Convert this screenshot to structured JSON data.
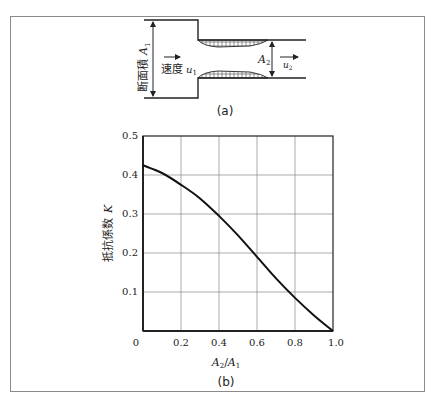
{
  "diagram_a": {
    "caption": "(a)",
    "area1_label": "断面積",
    "area1_symbol": "A",
    "area1_sub": "1",
    "area2_symbol": "A",
    "area2_sub": "2",
    "velocity_label": "速度",
    "u1_symbol": "u",
    "u1_sub": "1",
    "u2_symbol": "u",
    "u2_sub": "2"
  },
  "chart_caption": "(b)",
  "chart_data": {
    "type": "line",
    "title": "",
    "xlabel": "A2/A1",
    "ylabel": "抵抗係数 K",
    "xlim": [
      0,
      1.0
    ],
    "ylim": [
      0,
      0.5
    ],
    "x_ticks": [
      "0",
      "0.2",
      "0.4",
      "0.6",
      "0.8",
      "1.0"
    ],
    "y_ticks": [
      "0.1",
      "0.2",
      "0.3",
      "0.4",
      "0.5"
    ],
    "grid": true,
    "series": [
      {
        "name": "K",
        "x": [
          0.0,
          0.1,
          0.2,
          0.3,
          0.4,
          0.5,
          0.6,
          0.7,
          0.8,
          0.9,
          1.0
        ],
        "values": [
          0.425,
          0.405,
          0.375,
          0.34,
          0.295,
          0.245,
          0.19,
          0.135,
          0.085,
          0.04,
          0.0
        ]
      }
    ]
  },
  "axis": {
    "ylabel_text": "抵抗係数",
    "ylabel_symbol": "K",
    "xlabel_num": "A",
    "xlabel_num_sub": "2",
    "xlabel_den": "A",
    "xlabel_den_sub": "1"
  }
}
